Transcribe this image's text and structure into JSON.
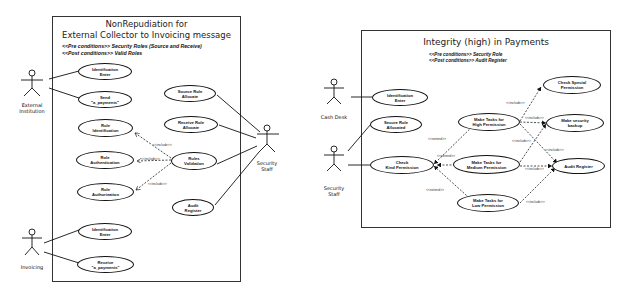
{
  "diagrams": [
    {
      "title_line1": "NonRepudiation for",
      "title_line2": "External Collector to Invoicing message",
      "pre_conditions": "<<Pre conditions>>   Security Roles (Source and Receive)",
      "post_conditions": "<<Post conditions>> Valid Roles",
      "actors": [
        {
          "label": "External\nInstitution"
        },
        {
          "label": "Security\nStaff"
        },
        {
          "label": "Invoicing"
        }
      ],
      "use_cases": [
        {
          "label": "Identification\nEnter"
        },
        {
          "label": "Send\n\"a_payments\""
        },
        {
          "label": "Source Role\nAllocate"
        },
        {
          "label": "Receive Role\nAllocate"
        },
        {
          "label": "Role\nIdentification"
        },
        {
          "label": "Role\nAuthentication"
        },
        {
          "label": "Rules\nValidation"
        },
        {
          "label": "Role\nAuthorization"
        },
        {
          "label": "Audit\nRegister"
        },
        {
          "label": "Identification\nEnter"
        },
        {
          "label": "Receive\n\"a_payments\""
        }
      ],
      "stereotypes": [
        "<<include>>",
        "<<include>>",
        "<<include>>"
      ]
    },
    {
      "title": "Integrity (high) in Payments",
      "pre_conditions": "<<Pre conditions>>   Security Role",
      "post_conditions": "<<Post conditions>> Audit Register",
      "actors": [
        {
          "label": "Cash Desk"
        },
        {
          "label": "Security\nStaff"
        }
      ],
      "use_cases": [
        {
          "label": "Identification\nEnter"
        },
        {
          "label": "Secure Role\nAllocated"
        },
        {
          "label": "Check\nKind Permission"
        },
        {
          "label": "Make Tasks for\nHigh Permission"
        },
        {
          "label": "Make Tasks for\nMedium Permission"
        },
        {
          "label": "Make Tasks for\nLow Permission"
        },
        {
          "label": "Check Special\nPermission"
        },
        {
          "label": "Make security\nbackup"
        },
        {
          "label": "Audit Register"
        }
      ],
      "stereotypes": [
        "<<extend>>",
        "<<extend>>",
        "<<extend>>",
        "<<include>>",
        "<<include>>",
        "<<include>>",
        "<<include>>",
        "<<include>>",
        "<<include>>"
      ]
    }
  ]
}
